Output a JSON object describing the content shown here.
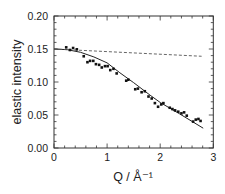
{
  "chart_data": {
    "type": "scatter",
    "title": "",
    "xlabel": "Q / Å⁻¹",
    "ylabel": "elastic intensity",
    "xlim": [
      0,
      3
    ],
    "ylim": [
      0.0,
      0.2
    ],
    "xticks": [
      0,
      1,
      2,
      3
    ],
    "xtick_labels": [
      "0",
      "1",
      "2",
      "3"
    ],
    "x_minor_step": 0.2,
    "yticks": [
      0.0,
      0.05,
      0.1,
      0.15,
      0.2
    ],
    "ytick_labels": [
      "0.00",
      "0.05",
      "0.10",
      "0.15",
      "0.20"
    ],
    "y_minor_step": 0.01,
    "grid": false,
    "legend": null,
    "series": [
      {
        "name": "measured elastic intensity",
        "kind": "scatter",
        "marker": "filled-square",
        "color": "#111111",
        "x": [
          0.23,
          0.3,
          0.36,
          0.43,
          0.56,
          0.63,
          0.68,
          0.74,
          0.79,
          0.85,
          0.9,
          0.96,
          1.01,
          1.06,
          1.12,
          1.18,
          1.36,
          1.4,
          1.53,
          1.58,
          1.65,
          1.71,
          1.78,
          1.84,
          1.9,
          1.96,
          2.02,
          2.06,
          2.18,
          2.23,
          2.28,
          2.34,
          2.4,
          2.45,
          2.5,
          2.62,
          2.67,
          2.72,
          2.76
        ],
        "y": [
          0.1525,
          0.1485,
          0.1515,
          0.1495,
          0.139,
          0.13,
          0.132,
          0.132,
          0.127,
          0.126,
          0.122,
          0.124,
          0.124,
          0.118,
          0.12,
          0.113,
          0.102,
          0.1035,
          0.089,
          0.09,
          0.0845,
          0.086,
          0.078,
          0.075,
          0.068,
          0.0625,
          0.066,
          0.068,
          0.061,
          0.059,
          0.057,
          0.055,
          0.0525,
          0.054,
          0.049,
          0.04,
          0.043,
          0.044,
          0.041
        ]
      },
      {
        "name": "model fit",
        "kind": "line",
        "style": "solid",
        "color": "#222222",
        "x": [
          0,
          0.25,
          0.5,
          0.75,
          1.0,
          1.24,
          1.5,
          1.81,
          2.0,
          2.37,
          2.81
        ],
        "y": [
          0.15,
          0.149,
          0.145,
          0.138,
          0.129,
          0.114,
          0.099,
          0.08,
          0.069,
          0.0515,
          0.03
        ]
      },
      {
        "name": "reference",
        "kind": "line",
        "style": "dashed",
        "color": "#555555",
        "x": [
          0,
          2.78
        ],
        "y": [
          0.15,
          0.139
        ]
      }
    ]
  },
  "layout": {
    "plot_left": 54,
    "plot_right": 213.3,
    "plot_top": 16,
    "plot_bottom": 148
  }
}
